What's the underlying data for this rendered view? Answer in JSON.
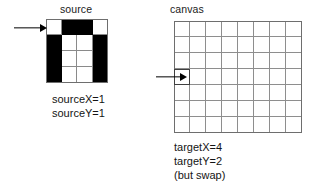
{
  "figure": {
    "type": "grid-copy-diagram",
    "background": "#ffffff",
    "ink": "#000000"
  },
  "source_panel": {
    "title": "source",
    "grid": {
      "columns": 4,
      "rows": 4,
      "cells": [
        [
          0,
          1,
          1,
          0
        ],
        [
          1,
          0,
          0,
          1
        ],
        [
          1,
          0,
          0,
          1
        ],
        [
          1,
          0,
          0,
          1
        ]
      ],
      "on_color": "#000000",
      "off_color": "#ffffff",
      "line_color": "#8a8a8a"
    },
    "arrow": {
      "name": "source-row-pointer",
      "points_to_row": 1,
      "direction": "right"
    },
    "caption": {
      "lines": [
        "sourceX=1",
        "sourceY=1"
      ],
      "sourceX": 1,
      "sourceY": 1
    }
  },
  "canvas_panel": {
    "title": "canvas",
    "grid": {
      "columns": 8,
      "rows": 7,
      "line_color": "#8e8e8e",
      "fill_color": "#ffffff"
    },
    "arrow": {
      "name": "canvas-cell-pointer",
      "points_to_row": 4,
      "points_to_column": 1,
      "direction": "right"
    },
    "highlight_cell": {
      "row": 4,
      "column": 1
    },
    "caption": {
      "lines": [
        "targetX=4",
        "targetY=2",
        "(but swap)"
      ],
      "targetX": 4,
      "targetY": 2,
      "note": "(but swap)"
    }
  }
}
